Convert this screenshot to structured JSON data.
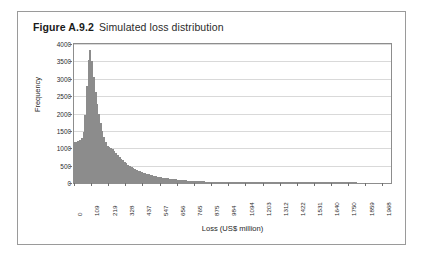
{
  "figure": {
    "label": "Figure A.9.2",
    "caption": "Simulated loss distribution"
  },
  "colors": {
    "bar": "#8c8c8c",
    "grid": "#d9d9d9",
    "axis": "#8d8d8d",
    "frame": "#9a9a9a",
    "text": "#2b2b2b"
  },
  "chart_data": {
    "type": "bar",
    "title": "Simulated loss distribution",
    "xlabel": "Loss (US$ million)",
    "ylabel": "Frequency",
    "grid": true,
    "legend": false,
    "ylim": [
      0,
      4000
    ],
    "yticks": [
      0,
      500,
      1000,
      1500,
      2000,
      2500,
      3000,
      3500,
      4000
    ],
    "ytick_labels": [
      "0",
      "500",
      "1000",
      "1500",
      "2000",
      "2500",
      "3000",
      "3500",
      "4000"
    ],
    "xlim": [
      0,
      2023
    ],
    "xticks": [
      0,
      109,
      219,
      328,
      437,
      547,
      656,
      765,
      875,
      984,
      1094,
      1203,
      1312,
      1422,
      1531,
      1640,
      1750,
      1859,
      1968
    ],
    "xtick_labels": [
      "0",
      "109",
      "219",
      "328",
      "437",
      "547",
      "656",
      "765",
      "875",
      "984",
      "1094",
      "1203",
      "1312",
      "1422",
      "1531",
      "1640",
      "1750",
      "1859",
      "1968"
    ],
    "bin_width": 10.94,
    "categories": [
      "0",
      "11",
      "22",
      "33",
      "44",
      "55",
      "66",
      "77",
      "87",
      "98",
      "109",
      "120",
      "131",
      "142",
      "153",
      "164",
      "175",
      "186",
      "197",
      "208",
      "219",
      "230",
      "241",
      "252",
      "263",
      "273",
      "284",
      "295",
      "306",
      "317",
      "328",
      "339",
      "350",
      "361",
      "372",
      "383",
      "394",
      "405",
      "416",
      "427",
      "437",
      "448",
      "459",
      "470",
      "481",
      "492",
      "503",
      "514",
      "525",
      "536",
      "547",
      "558",
      "569",
      "580",
      "591",
      "601",
      "612",
      "623",
      "634",
      "645",
      "656",
      "667",
      "678",
      "689",
      "700",
      "711",
      "722",
      "733",
      "744",
      "755",
      "765",
      "776",
      "787",
      "798",
      "809",
      "820",
      "831",
      "842",
      "853",
      "864",
      "875",
      "886",
      "897",
      "908",
      "919",
      "929",
      "940",
      "951",
      "962",
      "973",
      "984",
      "995",
      "1006",
      "1017",
      "1028",
      "1039",
      "1050",
      "1061",
      "1072",
      "1083",
      "1094",
      "1105",
      "1116",
      "1126",
      "1137",
      "1148",
      "1159",
      "1170",
      "1181",
      "1192",
      "1203",
      "1214",
      "1225",
      "1236",
      "1247",
      "1257",
      "1268",
      "1279",
      "1290",
      "1301",
      "1312",
      "1323",
      "1334",
      "1345",
      "1356",
      "1367",
      "1378",
      "1389",
      "1400",
      "1411",
      "1422",
      "1433",
      "1444",
      "1454",
      "1465",
      "1476",
      "1487",
      "1498",
      "1509",
      "1520",
      "1531",
      "1542",
      "1553",
      "1564",
      "1575",
      "1586",
      "1597",
      "1608",
      "1619",
      "1630",
      "1640",
      "1651",
      "1662",
      "1673",
      "1684",
      "1695",
      "1706",
      "1717",
      "1728",
      "1739",
      "1750",
      "1761",
      "1772",
      "1782",
      "1793",
      "1804",
      "1815",
      "1826",
      "1837",
      "1848",
      "1859",
      "1870",
      "1881",
      "1892",
      "1903",
      "1914",
      "1925",
      "1936",
      "1947",
      "1958",
      "1968",
      "1979",
      "1990",
      "2001",
      "2012"
    ],
    "values": [
      1180,
      1190,
      1210,
      1240,
      1300,
      1480,
      1950,
      2780,
      3550,
      3820,
      3500,
      3050,
      2620,
      2280,
      1980,
      1720,
      1510,
      1330,
      1180,
      1060,
      1030,
      1010,
      980,
      930,
      870,
      810,
      750,
      700,
      650,
      605,
      565,
      528,
      494,
      462,
      432,
      405,
      380,
      357,
      335,
      315,
      296,
      279,
      262,
      247,
      233,
      220,
      207,
      196,
      185,
      175,
      166,
      157,
      148,
      140,
      133,
      126,
      120,
      113,
      107,
      102,
      97,
      92,
      87,
      83,
      79,
      75,
      71,
      68,
      64,
      61,
      58,
      55,
      52,
      50,
      47,
      45,
      43,
      41,
      39,
      37,
      35,
      33,
      32,
      30,
      29,
      27,
      26,
      25,
      24,
      22,
      21,
      20,
      19,
      18,
      18,
      17,
      16,
      15,
      15,
      14,
      13,
      13,
      12,
      12,
      11,
      11,
      10,
      10,
      9,
      9,
      8,
      8,
      8,
      7,
      7,
      7,
      6,
      6,
      6,
      6,
      5,
      5,
      5,
      5,
      4,
      4,
      4,
      4,
      4,
      3,
      3,
      3,
      3,
      3,
      3,
      3,
      2,
      2,
      2,
      2,
      2,
      2,
      2,
      2,
      2,
      2,
      1,
      1,
      1,
      1,
      1,
      1,
      1,
      1,
      1,
      1,
      1,
      1,
      1,
      1,
      1,
      1,
      1,
      1,
      1,
      0,
      0,
      0,
      0,
      0,
      0,
      0,
      0,
      0,
      0,
      0,
      0,
      0,
      0,
      0,
      0,
      0,
      0,
      0,
      0
    ]
  }
}
